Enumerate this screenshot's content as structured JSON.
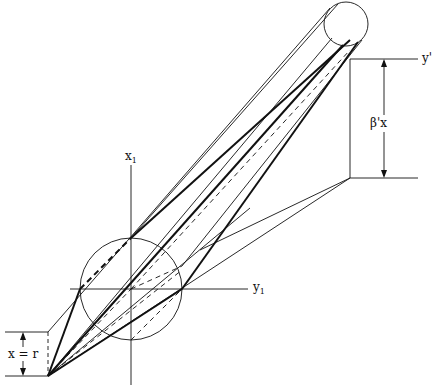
{
  "diagram": {
    "labels": {
      "x_axis": "x",
      "x_axis_sub": "1",
      "y_axis": "y",
      "y_axis_sub": "1",
      "y_prime": "y'",
      "beta_x": "β'x",
      "x_eq_r": "x = r"
    },
    "colors": {
      "line": "#111111",
      "background": "#ffffff"
    }
  }
}
